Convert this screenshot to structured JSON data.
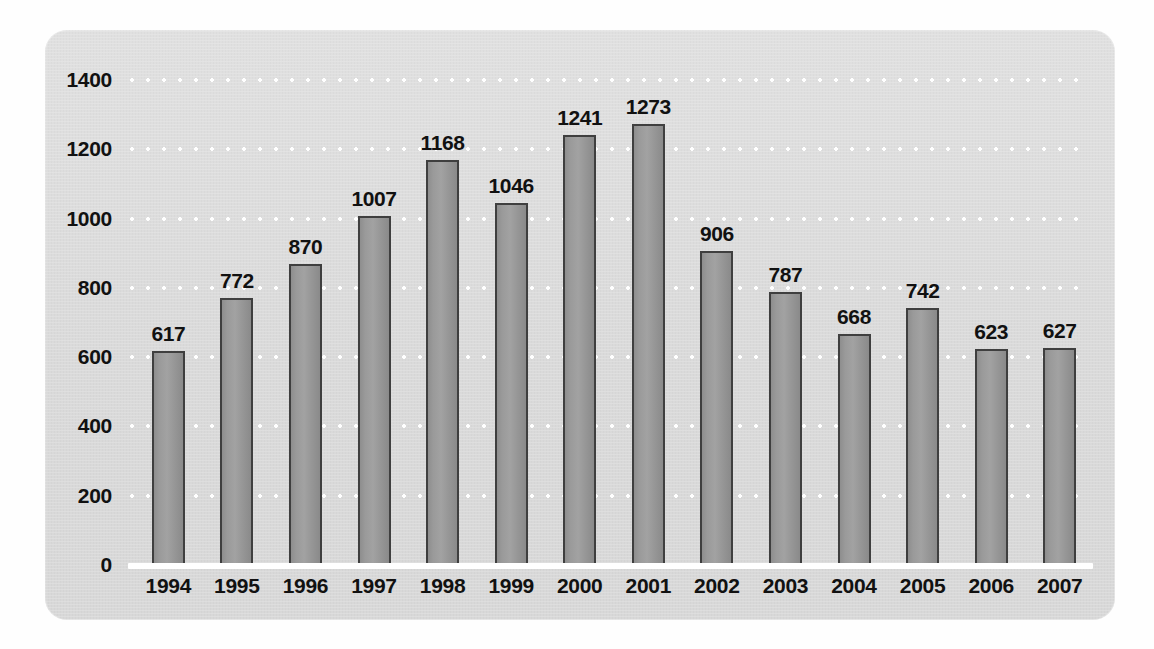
{
  "chart_data": {
    "type": "bar",
    "title": "",
    "subtitle": "",
    "xlabel": "",
    "ylabel": "",
    "categories": [
      "1994",
      "1995",
      "1996",
      "1997",
      "1998",
      "1999",
      "2000",
      "2001",
      "2002",
      "2003",
      "2004",
      "2005",
      "2006",
      "2007"
    ],
    "values": [
      617,
      772,
      870,
      1007,
      1168,
      1046,
      1241,
      1273,
      906,
      787,
      668,
      742,
      623,
      627
    ],
    "value_labels": [
      "617",
      "772",
      "870",
      "1007",
      "1168",
      "1046",
      "1241",
      "1273",
      "906",
      "787",
      "668",
      "742",
      "623",
      "627"
    ],
    "ylim": [
      0,
      1400
    ],
    "ytick_values": [
      0,
      200,
      400,
      600,
      800,
      1000,
      1200,
      1400
    ],
    "ytick_labels": [
      "0",
      "200",
      "400",
      "600",
      "800",
      "1000",
      "1200",
      "1400"
    ],
    "ytick_step": 200,
    "grid": true,
    "grid_style": "dotted",
    "grid_color": "#ffffff",
    "legend": false,
    "legend_position": "none",
    "bar_fill_color": "#9a9a9a",
    "bar_border_color": "#3f3f3f",
    "panel_background": "#dedede",
    "label_color": "#111111",
    "axis_baseline_color": "#ffffff",
    "series": [
      {
        "name": "",
        "values": [
          617,
          772,
          870,
          1007,
          1168,
          1046,
          1241,
          1273,
          906,
          787,
          668,
          742,
          623,
          627
        ]
      }
    ]
  }
}
